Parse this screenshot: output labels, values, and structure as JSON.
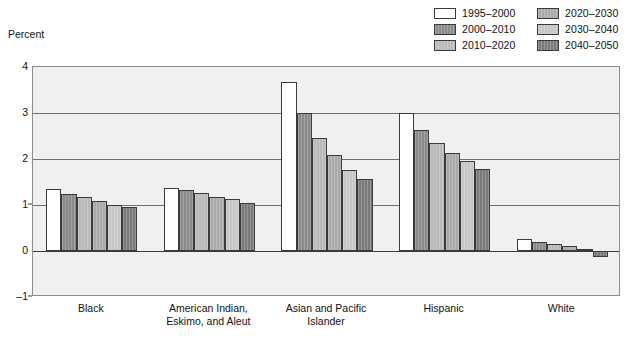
{
  "axis_title": "Percent",
  "legend": {
    "items": [
      {
        "label": "1995–2000",
        "color": "#ffffff"
      },
      {
        "label": "2000–2010",
        "color": "#8a8a8a"
      },
      {
        "label": "2010–2020",
        "color": "#b9b9b9"
      },
      {
        "label": "2020–2030",
        "color": "#a9a9a9"
      },
      {
        "label": "2030–2040",
        "color": "#c6c6c6"
      },
      {
        "label": "2040–2050",
        "color": "#7a7a7a"
      }
    ]
  },
  "yticks": [
    "4",
    "3",
    "2",
    "1",
    "0",
    "–1"
  ],
  "chart_data": {
    "type": "bar",
    "title": "",
    "xlabel": "",
    "ylabel": "Percent",
    "ylim": [
      -1,
      4
    ],
    "grid": true,
    "legend_position": "top-right",
    "categories": [
      "Black",
      "American Indian,\nEskimo, and Aleut",
      "Asian and Pacific\nIslander",
      "Hispanic",
      "White"
    ],
    "series": [
      {
        "name": "1995–2000",
        "color": "#ffffff",
        "values": [
          1.35,
          1.37,
          3.68,
          3.0,
          0.27
        ]
      },
      {
        "name": "2000–2010",
        "color": "#8a8a8a",
        "values": [
          1.23,
          1.32,
          3.01,
          2.64,
          0.19
        ]
      },
      {
        "name": "2010–2020",
        "color": "#b9b9b9",
        "values": [
          1.18,
          1.26,
          2.46,
          2.35,
          0.16
        ]
      },
      {
        "name": "2020–2030",
        "color": "#a9a9a9",
        "values": [
          1.08,
          1.18,
          2.09,
          2.12,
          0.1
        ]
      },
      {
        "name": "2030–2040",
        "color": "#c6c6c6",
        "values": [
          1.0,
          1.12,
          1.76,
          1.96,
          0.04
        ]
      },
      {
        "name": "2040–2050",
        "color": "#7a7a7a",
        "values": [
          0.96,
          1.05,
          1.56,
          1.79,
          -0.14
        ]
      }
    ]
  }
}
